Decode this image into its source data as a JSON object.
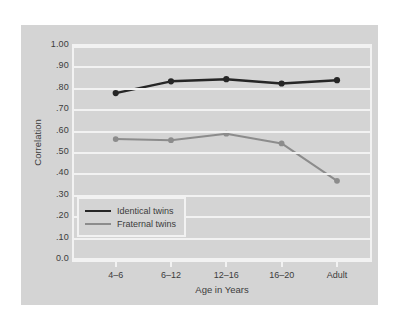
{
  "chart_data": {
    "type": "line",
    "title": "",
    "xlabel": "Age in Years",
    "ylabel": "Correlation",
    "categories": [
      "4–6",
      "6–12",
      "12–16",
      "16–20",
      "Adult"
    ],
    "ytick_labels": [
      "1.00",
      ".90",
      ".80",
      ".70",
      ".60",
      ".50",
      ".40",
      ".30",
      ".20",
      ".10",
      "0.0"
    ],
    "ytick_values": [
      1.0,
      0.9,
      0.8,
      0.7,
      0.6,
      0.5,
      0.4,
      0.3,
      0.2,
      0.1,
      0.0
    ],
    "ylim": [
      0.0,
      1.0
    ],
    "grid": "horizontal",
    "legend_position": "inside-lower-left",
    "series": [
      {
        "name": "Identical twins",
        "color": "#262626",
        "values": [
          0.78,
          0.835,
          0.845,
          0.825,
          0.84
        ]
      },
      {
        "name": "Fraternal twins",
        "color": "#8c8c8c",
        "values": [
          0.565,
          0.56,
          0.59,
          0.545,
          0.37
        ]
      }
    ]
  },
  "legend": {
    "items": [
      {
        "label": "Identical twins"
      },
      {
        "label": "Fraternal twins"
      }
    ]
  },
  "colors": {
    "panel_background": "#d4d4d4",
    "gridline": "#f2f2f2",
    "identical": "#262626",
    "fraternal": "#8c8c8c",
    "text": "#3c3c3c"
  }
}
